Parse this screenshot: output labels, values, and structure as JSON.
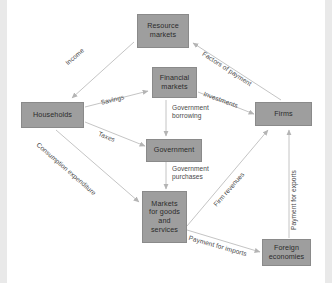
{
  "diagram": {
    "box_color": "#9e9e9e",
    "arrow_color": "#b0b0b0",
    "text_color": "#2b2b2b",
    "background": "#ffffff"
  },
  "nodes": [
    {
      "id": "resource_markets",
      "label": "Resource markets",
      "line1": "Resource",
      "line2": "markets",
      "line3": "",
      "line4": ""
    },
    {
      "id": "financial_markets",
      "label": "Financial markets",
      "line1": "Financial",
      "line2": "markets",
      "line3": "",
      "line4": ""
    },
    {
      "id": "households",
      "label": "Households",
      "line1": "Households",
      "line2": "",
      "line3": "",
      "line4": ""
    },
    {
      "id": "firms",
      "label": "Firms",
      "line1": "Firms",
      "line2": "",
      "line3": "",
      "line4": ""
    },
    {
      "id": "government",
      "label": "Government",
      "line1": "Government",
      "line2": "",
      "line3": "",
      "line4": ""
    },
    {
      "id": "goods_markets",
      "label": "Markets for goods and services",
      "line1": "Markets",
      "line2": "for goods",
      "line3": "and",
      "line4": "services"
    },
    {
      "id": "foreign",
      "label": "Foreign economies",
      "line1": "Foreign",
      "line2": "economies",
      "line3": "",
      "line4": ""
    }
  ],
  "flows": [
    {
      "id": "income",
      "label": "Income",
      "from": "Resource markets",
      "to": "Households"
    },
    {
      "id": "factors",
      "label": "Factors of payment",
      "from": "Firms",
      "to": "Resource markets"
    },
    {
      "id": "savings",
      "label": "Savings",
      "from": "Households",
      "to": "Financial markets"
    },
    {
      "id": "investments",
      "label": "Investments",
      "from": "Financial markets",
      "to": "Firms"
    },
    {
      "id": "govt_borrowing",
      "label": "Government borrowing",
      "line1": "Government",
      "line2": "borrowing",
      "from": "Financial markets",
      "to": "Government"
    },
    {
      "id": "taxes",
      "label": "Taxes",
      "from": "Households",
      "to": "Government"
    },
    {
      "id": "consumption",
      "label": "Consumption expenditure",
      "from": "Households",
      "to": "Markets for goods and services"
    },
    {
      "id": "govt_purchases",
      "label": "Government purchases",
      "line1": "Government",
      "line2": "purchases",
      "from": "Government",
      "to": "Markets for goods and services"
    },
    {
      "id": "firm_revenues",
      "label": "Firm revenues",
      "from": "Markets for goods and services",
      "to": "Firms"
    },
    {
      "id": "payment_imports",
      "label": "Payment for imports",
      "from": "Markets for goods and services",
      "to": "Foreign economies"
    },
    {
      "id": "payment_exports",
      "label": "Payment for exports",
      "from": "Foreign economies",
      "to": "Firms"
    }
  ]
}
